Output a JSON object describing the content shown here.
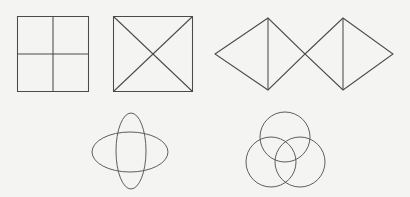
{
  "diagram": {
    "title": "Geometric Figures with Axes of Symmetry",
    "background_color": "#f4f4f2",
    "stroke_color": "#4a4a4a",
    "canvas": {
      "width": 410,
      "height": 197
    },
    "figure_count": 5,
    "figures": [
      {
        "id": "figure-1",
        "name": "square-with-cross-partition",
        "label": "Square divided into four quadrants",
        "row": "top",
        "column": 1,
        "shape_type": "square",
        "bounds": {
          "x": 17,
          "y": 16,
          "width": 72,
          "height": 76
        },
        "internal_lines": [
          "vertical-midline",
          "horizontal-midline"
        ],
        "region_count": 4
      },
      {
        "id": "figure-2",
        "name": "square-with-diagonals",
        "label": "Square divided by two diagonals",
        "row": "top",
        "column": 2,
        "shape_type": "square",
        "bounds": {
          "x": 113,
          "y": 16,
          "width": 80,
          "height": 76
        },
        "internal_lines": [
          "diagonal-tl-br",
          "diagonal-tr-bl"
        ],
        "region_count": 4
      },
      {
        "id": "figure-3",
        "name": "double-rhombus-bowtie",
        "label": "Two rhombi meeting at a point, each bisected vertically",
        "row": "top",
        "column": 3,
        "shape_type": "rhombus-pair",
        "left_rhombus": {
          "left_vertex": [
            215,
            54
          ],
          "top_vertex": [
            268,
            18
          ],
          "right_vertex": [
            305,
            54
          ],
          "bottom_vertex": [
            268,
            90
          ],
          "midline": "vertical"
        },
        "right_rhombus": {
          "left_vertex": [
            305,
            54
          ],
          "top_vertex": [
            343,
            18
          ],
          "right_vertex": [
            393,
            54
          ],
          "bottom_vertex": [
            343,
            90
          ],
          "midline": "vertical"
        },
        "region_count": 4
      },
      {
        "id": "figure-4",
        "name": "crossed-ellipses",
        "label": "Wide horizontal ellipse overlapping a narrow vertical ellipse",
        "row": "bottom",
        "column": 1,
        "shape_type": "ellipse-pair",
        "horizontal_ellipse": {
          "cx": 130,
          "cy": 152,
          "rx": 38,
          "ry": 20
        },
        "vertical_ellipse": {
          "cx": 131,
          "cy": 151,
          "rx": 15,
          "ry": 38
        },
        "region_count": 4
      },
      {
        "id": "figure-5",
        "name": "three-overlapping-circles",
        "label": "Three mutually overlapping circles in Venn arrangement",
        "row": "bottom",
        "column": 2,
        "shape_type": "circle-triple",
        "circles": [
          {
            "name": "top-circle",
            "cx": 285,
            "cy": 137,
            "r": 25
          },
          {
            "name": "bottom-left-circle",
            "cx": 271,
            "cy": 162,
            "r": 25
          },
          {
            "name": "bottom-right-circle",
            "cx": 300,
            "cy": 162,
            "r": 25
          }
        ],
        "region_count": 7
      }
    ]
  }
}
